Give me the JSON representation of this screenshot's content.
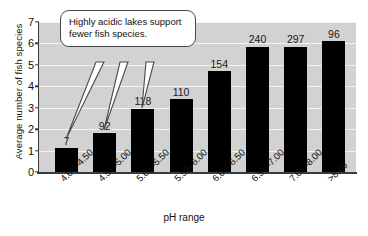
{
  "chart_data": {
    "type": "bar",
    "title": "",
    "xlabel": "pH range",
    "ylabel": "Average number of fish species",
    "categories": [
      "4.00–4.50",
      "4.51–5.00",
      "5.01–5.50",
      "5.51–6.00",
      "6.01–6.50",
      "6.51–7.00",
      "7.01–8.00",
      ">8.00"
    ],
    "values": [
      1.1,
      1.8,
      2.95,
      3.4,
      4.7,
      5.85,
      5.85,
      6.1
    ],
    "point_labels": [
      "7",
      "92",
      "118",
      "110",
      "154",
      "240",
      "297",
      "96"
    ],
    "ylim": [
      0,
      7
    ],
    "yticks": [
      0,
      1,
      2,
      3,
      4,
      5,
      6,
      7
    ],
    "ytick_labels": [
      "0",
      "1",
      "2",
      "3",
      "4",
      "5",
      "6",
      "7"
    ],
    "grid": true,
    "legend": "none",
    "bar_color": "#000000",
    "plot_background": "#d2d2d2",
    "gridline_color": "#f2f2f2",
    "annotations": [
      {
        "name": "acidity-callout",
        "text": "Highly acidic lakes support fewer fish species.",
        "points_to": [
          "4.00–4.50",
          "4.51–5.00",
          "5.01–5.50"
        ]
      }
    ]
  }
}
